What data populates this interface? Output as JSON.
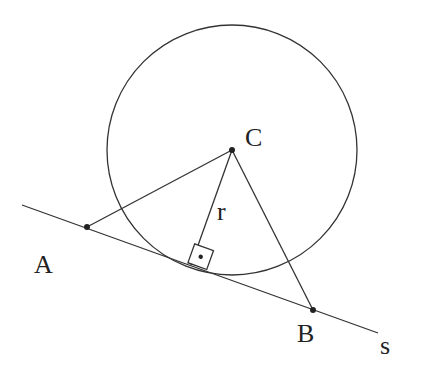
{
  "diagram": {
    "colors": {
      "stroke": "#333333",
      "text": "#222222",
      "background": "#ffffff"
    },
    "labels": {
      "center": "C",
      "radius": "r",
      "point_a": "A",
      "point_b": "B",
      "line": "s"
    },
    "circle": {
      "cx": 232,
      "cy": 150,
      "r": 125
    },
    "points": {
      "C": {
        "x": 232,
        "y": 150
      },
      "A": {
        "x": 87,
        "y": 227
      },
      "B": {
        "x": 313,
        "y": 310
      },
      "T": {
        "x": 191,
        "y": 268
      }
    },
    "right_angle_marker": "square with dot at tangent point"
  }
}
